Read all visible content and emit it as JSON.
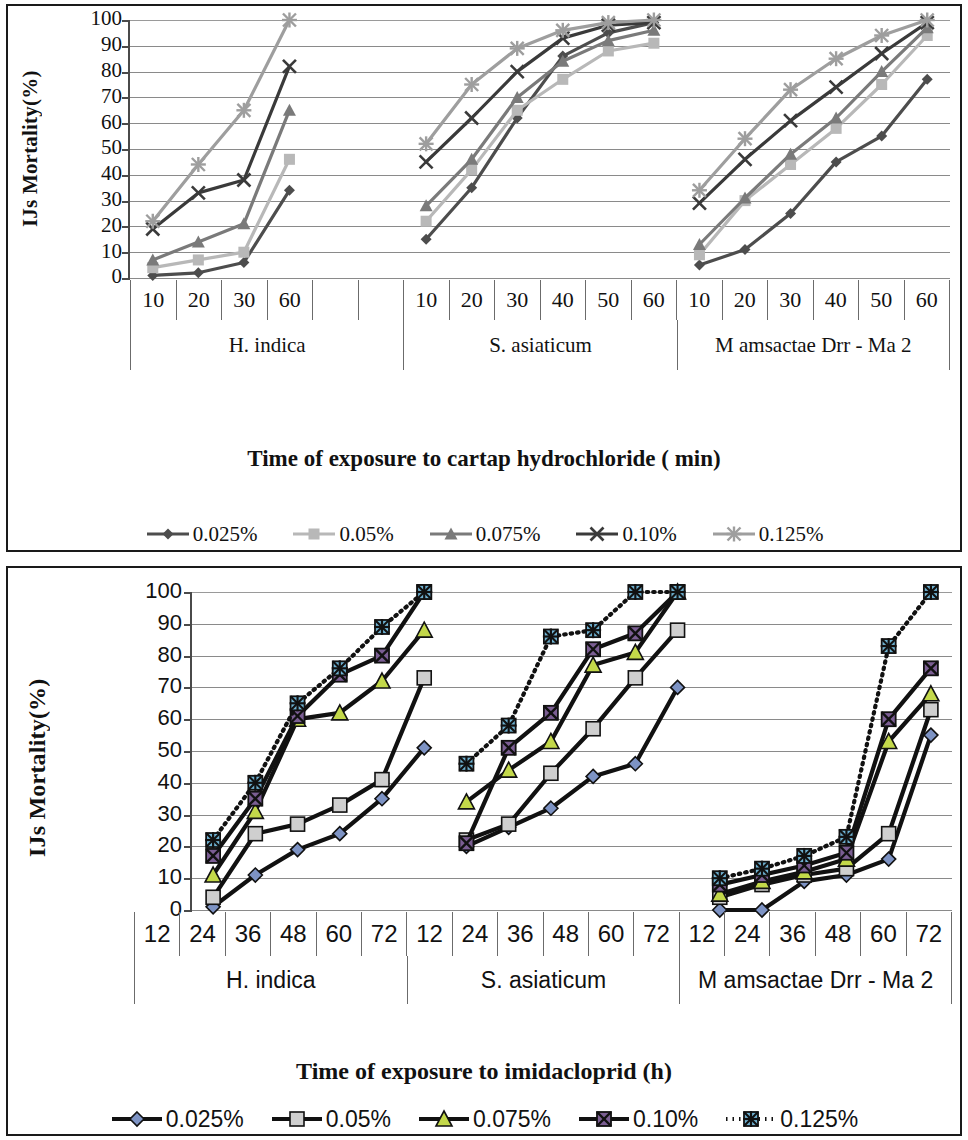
{
  "figure": {
    "panels": [
      {
        "id": "cartap",
        "y_axis_title": "IJs Mortality(%)",
        "x_axis_title": "Time of exposure to cartap hydrochloride ( min)",
        "y_ticks": [
          "100",
          "90",
          "80",
          "70",
          "60",
          "50",
          "40",
          "30",
          "20",
          "10",
          "0"
        ],
        "groups": [
          {
            "name": "H. indica",
            "cells": [
              "10",
              "20",
              "30",
              "60",
              "",
              ""
            ]
          },
          {
            "name": "S. asiaticum",
            "cells": [
              "10",
              "20",
              "30",
              "40",
              "50",
              "60"
            ]
          },
          {
            "name": "M amsactae Drr - Ma 2",
            "cells": [
              "10",
              "20",
              "30",
              "40",
              "50",
              "60"
            ]
          }
        ],
        "legend": [
          {
            "label": "0.025%",
            "marker": "diamond",
            "color": "#4d4d4d",
            "line": "solid"
          },
          {
            "label": "0.05%",
            "marker": "square",
            "color": "#b8b8b8",
            "line": "solid"
          },
          {
            "label": "0.075%",
            "marker": "triangle",
            "color": "#7a7a7a",
            "line": "solid"
          },
          {
            "label": "0.10%",
            "marker": "cross",
            "color": "#3a3a3a",
            "line": "solid"
          },
          {
            "label": "0.125%",
            "marker": "star",
            "color": "#9e9e9e",
            "line": "solid"
          }
        ]
      },
      {
        "id": "imidacloprid",
        "y_axis_title": "IJs Mortality(%)",
        "x_axis_title": "Time of exposure to imidacloprid (h)",
        "y_ticks": [
          "100",
          "90",
          "80",
          "70",
          "60",
          "50",
          "40",
          "30",
          "20",
          "10",
          "0"
        ],
        "groups": [
          {
            "name": "H. indica",
            "cells": [
              "12",
              "24",
              "36",
              "48",
              "60",
              "72"
            ]
          },
          {
            "name": "S. asiaticum",
            "cells": [
              "12",
              "24",
              "36",
              "48",
              "60",
              "72"
            ]
          },
          {
            "name": "M amsactae Drr - Ma 2",
            "cells": [
              "12",
              "24",
              "36",
              "48",
              "60",
              "72"
            ]
          }
        ],
        "legend": [
          {
            "label": "0.025%",
            "marker": "diamond",
            "color": "#7d93c4",
            "line": "solid"
          },
          {
            "label": "0.05%",
            "marker": "square",
            "color": "#cfcfcf",
            "line": "solid"
          },
          {
            "label": "0.075%",
            "marker": "triangle",
            "color": "#c3d84a",
            "line": "solid"
          },
          {
            "label": "0.10%",
            "marker": "xsquare",
            "color": "#7b5e93",
            "line": "solid"
          },
          {
            "label": "0.125%",
            "marker": "starsq",
            "color": "#6fb2d2",
            "line": "dotted"
          }
        ]
      }
    ]
  },
  "chart_data": [
    {
      "type": "line",
      "title": "",
      "xlabel": "Time of exposure to cartap hydrochloride ( min)",
      "ylabel": "IJs Mortality(%)",
      "ylim": [
        0,
        100
      ],
      "ytick_step": 10,
      "grid": true,
      "legend_position": "bottom",
      "groups": [
        {
          "name": "H. indica",
          "categories": [
            "10",
            "20",
            "30",
            "60"
          ]
        },
        {
          "name": "S. asiaticum",
          "categories": [
            "10",
            "20",
            "30",
            "40",
            "50",
            "60"
          ]
        },
        {
          "name": "M amsactae Drr - Ma 2",
          "categories": [
            "10",
            "20",
            "30",
            "40",
            "50",
            "60"
          ]
        }
      ],
      "series": [
        {
          "name": "0.025%",
          "values": {
            "H. indica": [
              1,
              2,
              6,
              34
            ],
            "S. asiaticum": [
              15,
              35,
              62,
              86,
              95,
              99
            ],
            "M amsactae Drr - Ma 2": [
              5,
              11,
              25,
              45,
              55,
              77
            ]
          }
        },
        {
          "name": "0.05%",
          "values": {
            "H. indica": [
              4,
              7,
              10,
              46
            ],
            "S. asiaticum": [
              22,
              42,
              65,
              77,
              88,
              91
            ],
            "M amsactae Drr - Ma 2": [
              9,
              30,
              44,
              58,
              75,
              94
            ]
          }
        },
        {
          "name": "0.075%",
          "values": {
            "H. indica": [
              7,
              14,
              21,
              65
            ],
            "S. asiaticum": [
              28,
              46,
              70,
              84,
              92,
              96
            ],
            "M amsactae Drr - Ma 2": [
              13,
              31,
              48,
              62,
              80,
              97
            ]
          }
        },
        {
          "name": "0.10%",
          "values": {
            "H. indica": [
              19,
              33,
              38,
              82
            ],
            "S. asiaticum": [
              45,
              62,
              80,
              93,
              98,
              99
            ],
            "M amsactae Drr - Ma 2": [
              29,
              46,
              61,
              74,
              87,
              99
            ]
          }
        },
        {
          "name": "0.125%",
          "values": {
            "H. indica": [
              22,
              44,
              65,
              100
            ],
            "S. asiaticum": [
              52,
              75,
              89,
              96,
              99,
              100
            ],
            "M amsactae Drr - Ma 2": [
              34,
              54,
              73,
              85,
              94,
              100
            ]
          }
        }
      ]
    },
    {
      "type": "line",
      "title": "",
      "xlabel": "Time of exposure to imidacloprid (h)",
      "ylabel": "IJs Mortality(%)",
      "ylim": [
        0,
        100
      ],
      "ytick_step": 10,
      "grid": true,
      "legend_position": "bottom",
      "groups": [
        {
          "name": "H. indica",
          "categories": [
            "12",
            "24",
            "36",
            "48",
            "60",
            "72"
          ]
        },
        {
          "name": "S. asiaticum",
          "categories": [
            "12",
            "24",
            "36",
            "48",
            "60",
            "72"
          ]
        },
        {
          "name": "M amsactae Drr - Ma 2",
          "categories": [
            "12",
            "24",
            "36",
            "48",
            "60",
            "72"
          ]
        }
      ],
      "series": [
        {
          "name": "0.025%",
          "values": {
            "H. indica": [
              1,
              11,
              19,
              24,
              35,
              51
            ],
            "S. asiaticum": [
              20,
              26,
              32,
              42,
              46,
              70
            ],
            "M amsactae Drr - Ma 2": [
              0,
              0,
              9,
              11,
              16,
              55
            ]
          }
        },
        {
          "name": "0.05%",
          "values": {
            "H. indica": [
              4,
              24,
              27,
              33,
              41,
              73
            ],
            "S. asiaticum": [
              22,
              27,
              43,
              57,
              73,
              88
            ],
            "M amsactae Drr - Ma 2": [
              4,
              8,
              11,
              13,
              24,
              63
            ]
          }
        },
        {
          "name": "0.075%",
          "values": {
            "H. indica": [
              11,
              31,
              60,
              62,
              72,
              88
            ],
            "S. asiaticum": [
              34,
              44,
              53,
              77,
              81,
              100
            ],
            "M amsactae Drr - Ma 2": [
              5,
              9,
              12,
              16,
              53,
              68
            ]
          }
        },
        {
          "name": "0.10%",
          "values": {
            "H. indica": [
              17,
              35,
              61,
              74,
              80,
              100
            ],
            "S. asiaticum": [
              21,
              51,
              62,
              82,
              87,
              100
            ],
            "M amsactae Drr - Ma 2": [
              8,
              11,
              14,
              18,
              60,
              76
            ]
          }
        },
        {
          "name": "0.125%",
          "values": {
            "H. indica": [
              22,
              40,
              65,
              76,
              89,
              100
            ],
            "S. asiaticum": [
              46,
              58,
              86,
              88,
              100,
              100
            ],
            "M amsactae Drr - Ma 2": [
              10,
              13,
              17,
              23,
              83,
              100
            ]
          }
        }
      ]
    }
  ]
}
